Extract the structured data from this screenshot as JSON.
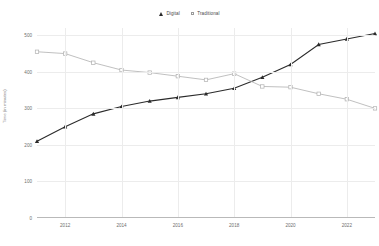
{
  "chart_data": {
    "type": "line",
    "title": "",
    "xlabel": "",
    "ylabel": "Time (in minutes)",
    "x": [
      2011,
      2012,
      2013,
      2014,
      2015,
      2016,
      2017,
      2018,
      2019,
      2020,
      2021,
      2022,
      2023
    ],
    "xlim": [
      2011,
      2023
    ],
    "ylim": [
      0,
      520
    ],
    "ytick_values": [
      0,
      100,
      200,
      300,
      400,
      500
    ],
    "ytick_labels": [
      "0",
      "100",
      "200",
      "300",
      "400",
      "500"
    ],
    "xtick_values": [
      2012,
      2014,
      2016,
      2018,
      2020,
      2022
    ],
    "xtick_labels": [
      "2012",
      "2014",
      "2016",
      "2018",
      "2020",
      "2022"
    ],
    "grid": true,
    "legend_position": "top-center",
    "series": [
      {
        "name": "Digital",
        "marker": "triangle",
        "color": "#2b2b2b",
        "values": [
          210,
          250,
          285,
          305,
          320,
          330,
          340,
          355,
          385,
          420,
          475,
          490,
          505
        ]
      },
      {
        "name": "Traditional",
        "marker": "square",
        "color": "#b0b0b0",
        "values": [
          455,
          450,
          425,
          405,
          398,
          388,
          378,
          395,
          360,
          358,
          340,
          325,
          300
        ]
      }
    ]
  },
  "legend": {
    "entries": [
      {
        "label": "Digital",
        "marker": "triangle-marker"
      },
      {
        "label": "Traditional",
        "marker": "square-marker"
      }
    ]
  },
  "colors": {
    "digital": "#2b2b2b",
    "traditional": "#b0b0b0",
    "grid": "#ececec",
    "axis": "#b9b9b9",
    "tick_text": "#6e6e6e"
  }
}
